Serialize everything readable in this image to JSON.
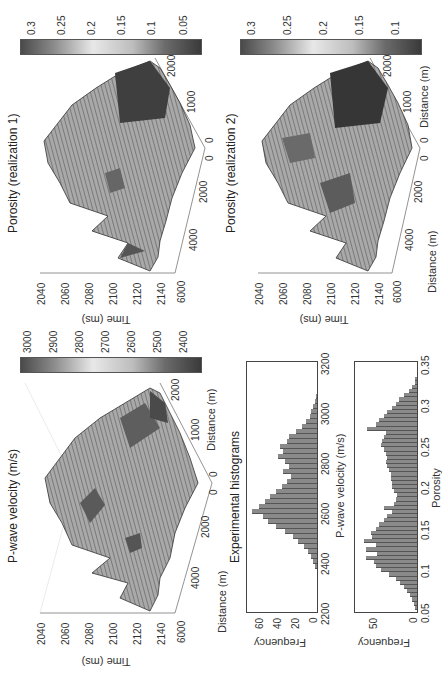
{
  "figure": {
    "panels": {
      "velocity3d": {
        "title": "P-wave velocity (m/s)",
        "zlabel": "Time (ms)",
        "ztick_labels": [
          "2040",
          "2060",
          "2080",
          "2100",
          "2120",
          "2140"
        ],
        "xlabel_left": "Distance (m)",
        "xtick_left": [
          "6000",
          "4000",
          "2000",
          "0"
        ],
        "xlabel_right": "Distance (m)",
        "xtick_right": [
          "0",
          "1000",
          "2000"
        ]
      },
      "velocity_colorbar": {
        "tick_labels": [
          "3000",
          "2900",
          "2800",
          "2700",
          "2600",
          "2500",
          "2400"
        ]
      },
      "porosity1": {
        "title": "Porosity (realization 1)",
        "zlabel": "Time (ms)",
        "ztick_labels": [
          "2040",
          "2060",
          "2080",
          "2100",
          "2120",
          "2140"
        ],
        "xtick_left": [
          "6000",
          "4000",
          "2000",
          "0"
        ],
        "xtick_right": [
          "0",
          "1000",
          "2000"
        ]
      },
      "porosity1_colorbar": {
        "tick_labels": [
          "0.3",
          "0.25",
          "0.2",
          "0.15",
          "0.1",
          "0.05"
        ]
      },
      "porosity2": {
        "title": "Porosity (realization 2)",
        "zlabel": "Time (ms)",
        "ztick_labels": [
          "2040",
          "2060",
          "2080",
          "2100",
          "2120",
          "2140"
        ],
        "xlabel_left": "Distance (m)",
        "xtick_left": [
          "6000",
          "4000",
          "2000",
          "0"
        ],
        "xlabel_right": "Distance (m)",
        "xtick_right": [
          "0",
          "1000",
          "2000"
        ]
      },
      "porosity2_colorbar": {
        "tick_labels": [
          "0.3",
          "0.25",
          "0.2",
          "0.15",
          "0.1"
        ]
      },
      "hist_title": "Experimental histograms"
    }
  },
  "chart_data": [
    {
      "type": "bar",
      "title": "Experimental histograms",
      "xlabel": "P-wave velocity (m/s)",
      "ylabel": "Frequency",
      "xlim": [
        2200,
        3200
      ],
      "ylim": [
        0,
        75
      ],
      "xticks": [
        "2200",
        "2400",
        "2600",
        "2800",
        "3000",
        "3200"
      ],
      "yticks": [
        "0",
        "20",
        "40",
        "60"
      ],
      "x": [
        2380,
        2400,
        2420,
        2440,
        2460,
        2480,
        2500,
        2520,
        2540,
        2560,
        2580,
        2600,
        2620,
        2640,
        2660,
        2680,
        2700,
        2720,
        2740,
        2760,
        2780,
        2800,
        2820,
        2840,
        2860,
        2880,
        2900,
        2920,
        2940,
        2960,
        2980,
        3000,
        3020,
        3040,
        3060
      ],
      "values": [
        2,
        4,
        6,
        10,
        14,
        20,
        26,
        34,
        44,
        52,
        58,
        70,
        62,
        56,
        50,
        44,
        38,
        32,
        28,
        36,
        30,
        34,
        42,
        36,
        40,
        32,
        30,
        22,
        16,
        12,
        8,
        6,
        4,
        2,
        1
      ]
    },
    {
      "type": "bar",
      "title": "",
      "xlabel": "Porosity",
      "ylabel": "Frequency",
      "xlim": [
        0.05,
        0.35
      ],
      "ylim": [
        0,
        75
      ],
      "xticks": [
        "0.05",
        "0.1",
        "0.15",
        "0.2",
        "0.25",
        "0.3",
        "0.35"
      ],
      "yticks": [
        "0",
        "50"
      ],
      "x": [
        0.055,
        0.06,
        0.065,
        0.07,
        0.075,
        0.08,
        0.085,
        0.09,
        0.095,
        0.1,
        0.105,
        0.11,
        0.115,
        0.12,
        0.125,
        0.13,
        0.135,
        0.14,
        0.145,
        0.15,
        0.155,
        0.16,
        0.165,
        0.17,
        0.175,
        0.18,
        0.185,
        0.19,
        0.195,
        0.2,
        0.205,
        0.21,
        0.215,
        0.22,
        0.225,
        0.23,
        0.235,
        0.24,
        0.245,
        0.25,
        0.255,
        0.26,
        0.265,
        0.27,
        0.275,
        0.28,
        0.285,
        0.29,
        0.295,
        0.3,
        0.305,
        0.31,
        0.315,
        0.32,
        0.325,
        0.33
      ],
      "values": [
        2,
        4,
        6,
        8,
        12,
        16,
        20,
        26,
        34,
        44,
        50,
        52,
        62,
        48,
        62,
        50,
        64,
        54,
        56,
        50,
        46,
        40,
        36,
        30,
        40,
        28,
        26,
        24,
        28,
        30,
        30,
        32,
        32,
        34,
        36,
        38,
        36,
        38,
        40,
        44,
        42,
        40,
        38,
        60,
        50,
        46,
        40,
        36,
        30,
        26,
        22,
        16,
        10,
        6,
        3,
        2
      ]
    }
  ]
}
